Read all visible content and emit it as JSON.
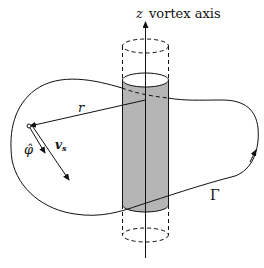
{
  "diagram": {
    "axis_label_var": "z",
    "axis_label_text": "vortex axis",
    "radius_label": "r",
    "phi_label": "φ̂",
    "velocity_label": "v",
    "velocity_subscript": "s",
    "contour_label": "Γ",
    "colors": {
      "line": "#111111",
      "core_fill": "#b5b5b5",
      "background": "#ffffff"
    }
  }
}
